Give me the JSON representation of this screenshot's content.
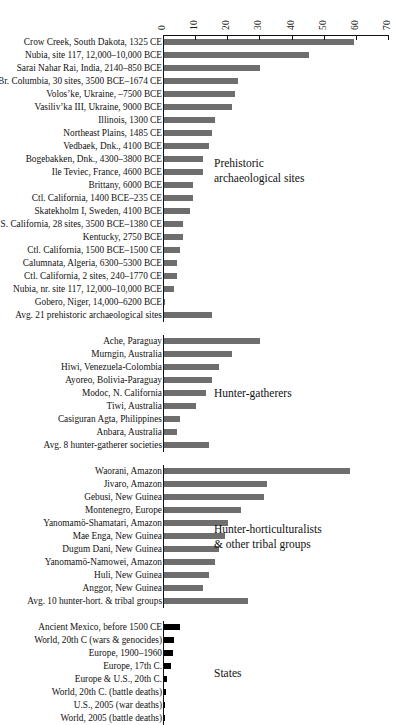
{
  "chart_data": {
    "type": "bar",
    "orientation": "horizontal",
    "title": "",
    "xlabel": "",
    "ylabel": "",
    "xlim": [
      0,
      70
    ],
    "xticks": [
      0,
      10,
      20,
      30,
      40,
      50,
      60,
      70
    ],
    "grid": false,
    "legend": false,
    "bar_color": "#6e6e6e",
    "states_bar_color": "#000000",
    "groups": [
      {
        "note": "Prehistoric\narchaeological sites",
        "kind": "prehistoric",
        "categories": [
          "Crow Creek, South Dakota, 1325 CE",
          "Nubia, site 117, 12,000–10,000 BCE",
          "Sarai Nahar Rai, India, 2140–850 BCE",
          "Br. Columbia, 30 sites, 3500 BCE–1674 CE",
          "Volos’ke, Ukraine, –7500 BCE",
          "Vasiliv’ka III, Ukraine, 9000 BCE",
          "Illinois, 1300 CE",
          "Northeast Plains, 1485 CE",
          "Vedbaek, Dnk., 4100 BCE",
          "Bogebakken, Dnk., 4300–3800 BCE",
          "Ile Teviec, France, 4600 BCE",
          "Brittany, 6000 BCE",
          "Ctl. California, 1400 BCE–235 CE",
          "Skatekholm I, Sweden, 4100 BCE",
          "S. California, 28 sites, 3500 BCE–1380 CE",
          "Kentucky, 2750 BCE",
          "Ctl. California, 1500 BCE–1500 CE",
          "Calumnata, Algeria, 6300–5300 BCE",
          "Ctl. California, 2 sites, 240–1770 CE",
          "Nubia, nr. site 117, 12,000–10,000 BCE",
          "Gobero, Niger, 14,000–6200 BCE",
          "Avg. 21 prehistoric archaeological sites"
        ],
        "values": [
          59,
          45,
          30,
          23,
          22,
          21,
          16,
          15,
          14,
          12,
          12,
          9,
          9,
          8,
          6,
          6,
          5,
          4,
          4,
          3,
          0.3,
          15
        ]
      },
      {
        "note": "Hunter-gatherers",
        "kind": "hunter-gatherer",
        "categories": [
          "Ache, Paraguay",
          "Murngin, Australia",
          "Hiwi, Venezuela-Colombia",
          "Ayoreo, Bolivia-Paraguay",
          "Modoc, N. California",
          "Tiwi, Australia",
          "Casiguran Agta, Philippines",
          "Anbara, Australia",
          "Avg. 8 hunter-gatherer societies"
        ],
        "values": [
          30,
          21,
          17,
          15,
          13,
          10,
          5,
          4,
          14
        ]
      },
      {
        "note": "Hunter-horticulturalists\n& other tribal groups",
        "kind": "hunter-horticulturalist",
        "categories": [
          "Waorani, Amazon",
          "Jivaro, Amazon",
          "Gebusi, New Guinea",
          "Montenegro, Europe",
          "Yanomamö-Shamatari, Amazon",
          "Mae Enga, New Guinea",
          "Dugum Dani, New Guinea",
          "Yanomamö-Namowei, Amazon",
          "Huli, New Guinea",
          "Anggor, New Guinea",
          "Avg. 10 hunter-hort. & tribal groups"
        ],
        "values": [
          58,
          32,
          31,
          24,
          20,
          19,
          17,
          16,
          14,
          12,
          26
        ]
      },
      {
        "note": "States",
        "kind": "states",
        "categories": [
          "Ancient Mexico, before 1500 CE",
          "World, 20th C (wars & genocides)",
          "Europe, 1900–1960",
          "Europe, 17th C.",
          "Europe & U.S., 20th C.",
          "World, 20th C. (battle deaths)",
          "U.S., 2005 (war deaths)",
          "World, 2005 (battle deaths)"
        ],
        "values": [
          5,
          3,
          2.7,
          2.2,
          0.9,
          0.7,
          0.1,
          0.1
        ]
      }
    ]
  }
}
